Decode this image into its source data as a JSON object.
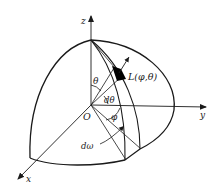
{
  "figure": {
    "type": "hemisphere radiance geometry diagram",
    "labels": {
      "z_axis": "z",
      "y_axis": "y",
      "x_axis": "x",
      "origin": "O",
      "zenith_angle": "θ",
      "zenith_increment": "dθ",
      "azimuth_angle": "φ",
      "solid_angle": "dω",
      "radiance": "L(φ,θ)"
    },
    "colors": {
      "stroke": "#1a1a1a",
      "patch_fill": "#000000",
      "background": "#ffffff"
    }
  }
}
